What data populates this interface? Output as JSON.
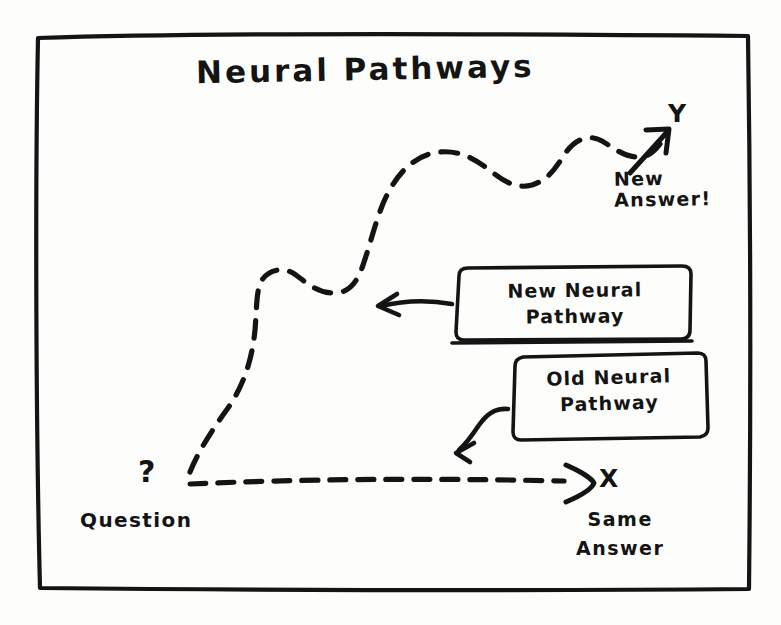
{
  "diagram": {
    "title": "Neural Pathways",
    "background_color": "#fdfdfc",
    "ink_color": "#141414",
    "style": "hand-drawn sketch"
  },
  "frame": {
    "name": "hand-drawn rectangular border"
  },
  "axes": {
    "y": {
      "label": "Y",
      "caption": "New\nAnswer!",
      "caption_line1": "New",
      "caption_line2": "Answer!"
    },
    "x": {
      "label": "X",
      "caption_line1": "Same",
      "caption_line2": "Answer"
    }
  },
  "origin": {
    "marker": "?",
    "label": "Question"
  },
  "callouts": [
    {
      "id": "new-neural-pathway",
      "line1": "New Neural",
      "line2": "Pathway",
      "full": "New Neural Pathway",
      "arrow": "straight-left-arrow"
    },
    {
      "id": "old-neural-pathway",
      "line1": "Old Neural",
      "line2": "Pathway",
      "full": "Old Neural Pathway",
      "arrow": "curved-down-left-arrow"
    }
  ],
  "paths": [
    {
      "id": "new-pathway-curve",
      "style": "dashed",
      "description": "winding ascending curve from Question to Y"
    },
    {
      "id": "old-pathway-line",
      "style": "dashed",
      "description": "straight horizontal line from Question to X"
    }
  ]
}
